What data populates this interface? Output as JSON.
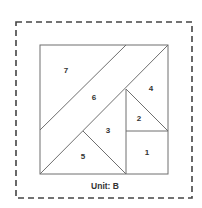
{
  "diagram": {
    "title": "Unit: B",
    "colors": {
      "background": "#ffffff",
      "line": "#6f6f6f",
      "dashed_border": "#444444",
      "text": "#333333"
    },
    "dashed_border": {
      "x1": 16,
      "y1": 22,
      "x2": 192,
      "y2": 198
    },
    "square": {
      "x1": 40,
      "y1": 45,
      "x2": 168,
      "y2": 174
    },
    "lines": [
      {
        "name": "piece7-piece6-boundary",
        "x1": 126,
        "y1": 45,
        "x2": 40,
        "y2": 130
      },
      {
        "name": "main-diagonal",
        "x1": 168,
        "y1": 45,
        "x2": 40,
        "y2": 174
      },
      {
        "name": "vertical-divider",
        "x1": 126,
        "y1": 89,
        "x2": 126,
        "y2": 174
      },
      {
        "name": "horizontal-divider",
        "x1": 126,
        "y1": 131,
        "x2": 168,
        "y2": 131
      },
      {
        "name": "piece2-hypotenuse",
        "x1": 126,
        "y1": 89,
        "x2": 168,
        "y2": 131
      },
      {
        "name": "piece5-right-edge",
        "x1": 83,
        "y1": 131,
        "x2": 126,
        "y2": 174
      }
    ],
    "pieces": [
      {
        "id": "1",
        "x": 147,
        "y": 155
      },
      {
        "id": "2",
        "x": 139,
        "y": 121
      },
      {
        "id": "3",
        "x": 108,
        "y": 133
      },
      {
        "id": "4",
        "x": 151,
        "y": 91
      },
      {
        "id": "5",
        "x": 83,
        "y": 159
      },
      {
        "id": "6",
        "x": 94,
        "y": 100
      },
      {
        "id": "7",
        "x": 66,
        "y": 73
      }
    ],
    "unit_label_position": {
      "x": 105,
      "y": 189
    }
  }
}
